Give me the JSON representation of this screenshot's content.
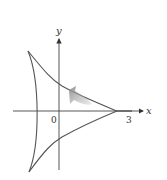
{
  "figure": {
    "axes": {
      "x_label": "x",
      "y_label": "y",
      "origin_label": "0",
      "x_tick_label": "3"
    },
    "colors": {
      "curve": "#555555",
      "axis": "#444444",
      "arrow": "#9a9a9a",
      "background": "#ffffff"
    }
  }
}
